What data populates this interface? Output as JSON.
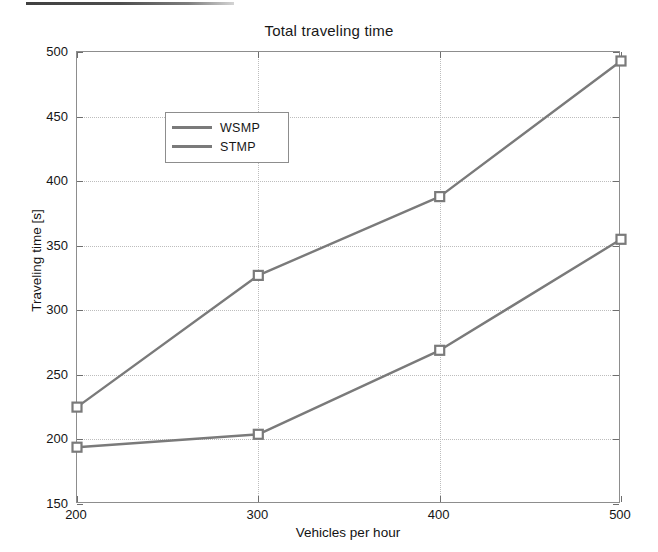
{
  "chart_data": {
    "type": "line",
    "title": "Total traveling time",
    "xlabel": "Vehicles per hour",
    "ylabel": "Traveling time [s]",
    "x": [
      200,
      300,
      400,
      500
    ],
    "xticks": [
      "200",
      "300",
      "400",
      "500"
    ],
    "yticks": [
      "150",
      "200",
      "250",
      "300",
      "350",
      "400",
      "450",
      "500"
    ],
    "xlim": [
      200,
      500
    ],
    "ylim": [
      150,
      500
    ],
    "grid": true,
    "legend_position": "upper left",
    "series": [
      {
        "name": "WSMP",
        "values": [
          225,
          327,
          388,
          493
        ],
        "color": "#7a7a7a",
        "marker": "square"
      },
      {
        "name": "STMP",
        "values": [
          194,
          204,
          269,
          355
        ],
        "color": "#7a7a7a",
        "marker": "square"
      }
    ]
  },
  "legend": {
    "entries": [
      {
        "label": "WSMP"
      },
      {
        "label": "STMP"
      }
    ]
  },
  "colors": {
    "line": "#7a7a7a",
    "axis": "#8d8d8d",
    "grid": "#bdbdbd",
    "text": "#151515",
    "background": "#ffffff"
  }
}
